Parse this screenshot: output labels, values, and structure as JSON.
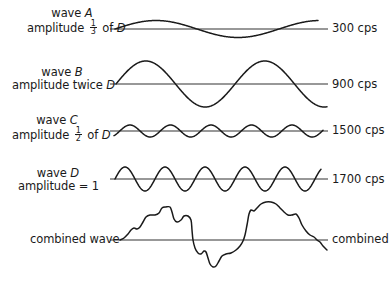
{
  "diagram": {
    "type": "waveform-superposition",
    "baseline_x_start": 110,
    "baseline_x_end": 328,
    "stroke_color": "#1a1a1a",
    "baseline_color": "#333333"
  },
  "waves": [
    {
      "id": "A",
      "label_prefix": "wave",
      "letter": "A",
      "amp_prefix": "amplitude",
      "amp_fraction_num": "1",
      "amp_fraction_den": "3",
      "amp_suffix": "of",
      "amp_ref": "D",
      "frequency_label": "300 cps",
      "baseline_y": 29,
      "amplitude_px": 8.5,
      "x_start": 115,
      "x_end": 318,
      "period_px": 164,
      "phase": 0
    },
    {
      "id": "B",
      "label_prefix": "wave",
      "letter": "B",
      "amp_prefix": "amplitude twice",
      "amp_ref": "D",
      "frequency_label": "900 cps",
      "baseline_y": 84,
      "amplitude_px": 23,
      "x_start": 116,
      "x_end": 327,
      "period_px": 119,
      "phase": 0
    },
    {
      "id": "C",
      "label_prefix": "wave",
      "letter": "C",
      "amp_prefix": "amplitude",
      "amp_fraction_num": "1",
      "amp_fraction_den": "2",
      "amp_suffix": "of",
      "amp_ref": "D",
      "frequency_label": "1500 cps",
      "baseline_y": 131,
      "amplitude_px": 6,
      "x_start": 114,
      "x_end": 323,
      "period_px": 40.5,
      "phase": -0.9
    },
    {
      "id": "D",
      "label_prefix": "wave",
      "letter": "D",
      "amp_prefix": "amplitude = 1",
      "frequency_label": "1700 cps",
      "baseline_y": 179,
      "amplitude_px": 12,
      "x_start": 115,
      "x_end": 321,
      "period_px": 40,
      "phase": 0
    }
  ],
  "combined": {
    "label": "combined wave",
    "end_label": "combined",
    "baseline_y": 240,
    "points": [
      [
        120,
        240
      ],
      [
        124,
        238
      ],
      [
        128,
        234
      ],
      [
        131,
        230
      ],
      [
        134,
        228
      ],
      [
        137,
        229
      ],
      [
        140,
        227
      ],
      [
        143,
        222
      ],
      [
        146,
        217
      ],
      [
        150,
        215
      ],
      [
        155,
        215
      ],
      [
        159,
        213
      ],
      [
        162,
        208
      ],
      [
        166,
        207
      ],
      [
        170,
        207
      ],
      [
        172,
        212
      ],
      [
        174,
        219
      ],
      [
        177,
        222
      ],
      [
        181,
        220
      ],
      [
        184,
        216
      ],
      [
        188,
        216
      ],
      [
        191,
        220
      ],
      [
        192,
        230
      ],
      [
        193,
        240
      ],
      [
        195,
        248
      ],
      [
        198,
        253
      ],
      [
        201,
        254
      ],
      [
        204,
        251
      ],
      [
        206,
        252
      ],
      [
        208,
        258
      ],
      [
        210,
        264
      ],
      [
        213,
        267
      ],
      [
        216,
        266
      ],
      [
        219,
        261
      ],
      [
        222,
        256
      ],
      [
        226,
        254
      ],
      [
        231,
        253
      ],
      [
        236,
        250
      ],
      [
        240,
        246
      ],
      [
        243,
        241
      ],
      [
        245,
        235
      ],
      [
        247,
        225
      ],
      [
        249,
        214
      ],
      [
        251,
        210
      ],
      [
        254,
        211
      ],
      [
        257,
        208
      ],
      [
        261,
        204
      ],
      [
        266,
        202
      ],
      [
        271,
        202
      ],
      [
        276,
        204
      ],
      [
        280,
        208
      ],
      [
        284,
        212
      ],
      [
        288,
        215
      ],
      [
        292,
        215
      ],
      [
        296,
        214
      ],
      [
        299,
        218
      ],
      [
        302,
        225
      ],
      [
        306,
        231
      ],
      [
        310,
        235
      ],
      [
        314,
        237
      ],
      [
        317,
        240
      ],
      [
        320,
        242
      ],
      [
        323,
        246
      ],
      [
        327,
        250
      ]
    ]
  }
}
